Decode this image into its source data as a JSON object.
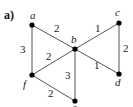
{
  "figure": {
    "part_label": "a)",
    "vertices": [
      {
        "id": "a",
        "label": "a"
      },
      {
        "id": "b",
        "label": "b"
      },
      {
        "id": "c",
        "label": "c"
      },
      {
        "id": "d",
        "label": "d"
      },
      {
        "id": "e",
        "label": "e"
      },
      {
        "id": "f",
        "label": "f"
      }
    ],
    "edges": [
      {
        "from": "a",
        "to": "b",
        "weight": "2"
      },
      {
        "from": "b",
        "to": "c",
        "weight": "1"
      },
      {
        "from": "c",
        "to": "d",
        "weight": "2"
      },
      {
        "from": "b",
        "to": "d",
        "weight": "1"
      },
      {
        "from": "a",
        "to": "f",
        "weight": "3"
      },
      {
        "from": "f",
        "to": "b",
        "weight": "2"
      },
      {
        "from": "b",
        "to": "e",
        "weight": "3"
      },
      {
        "from": "f",
        "to": "e",
        "weight": "2"
      }
    ]
  }
}
